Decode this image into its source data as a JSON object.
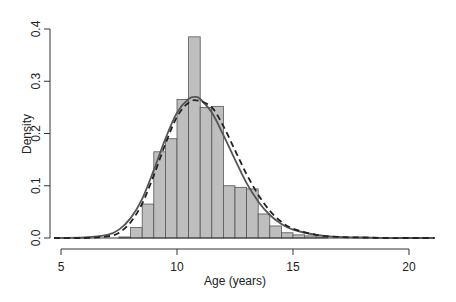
{
  "chart_data": {
    "type": "bar",
    "subtype": "histogram-with-density-curves",
    "title": "",
    "xlabel": "Age (years)",
    "ylabel": "Density",
    "xlim": [
      5,
      21.1
    ],
    "ylim": [
      0,
      0.4
    ],
    "x_ticks": [
      5,
      10,
      15,
      20
    ],
    "y_ticks": [
      0.0,
      0.1,
      0.2,
      0.3,
      0.4
    ],
    "y_tick_labels": [
      "0.0",
      "0.1",
      "0.2",
      "0.3",
      "0.4"
    ],
    "grid": false,
    "legend": null,
    "bin_width": 0.5,
    "bins": [
      {
        "start": 7.5,
        "end": 8.0,
        "density": 0.002
      },
      {
        "start": 8.0,
        "end": 8.5,
        "density": 0.02
      },
      {
        "start": 8.5,
        "end": 9.0,
        "density": 0.065
      },
      {
        "start": 9.0,
        "end": 9.5,
        "density": 0.165
      },
      {
        "start": 9.5,
        "end": 10.0,
        "density": 0.19
      },
      {
        "start": 10.0,
        "end": 10.5,
        "density": 0.265
      },
      {
        "start": 10.5,
        "end": 11.0,
        "density": 0.385
      },
      {
        "start": 11.0,
        "end": 11.5,
        "density": 0.25
      },
      {
        "start": 11.5,
        "end": 12.0,
        "density": 0.252
      },
      {
        "start": 12.0,
        "end": 12.5,
        "density": 0.1
      },
      {
        "start": 12.5,
        "end": 13.0,
        "density": 0.097
      },
      {
        "start": 13.0,
        "end": 13.5,
        "density": 0.094
      },
      {
        "start": 13.5,
        "end": 14.0,
        "density": 0.046
      },
      {
        "start": 14.0,
        "end": 14.5,
        "density": 0.023
      },
      {
        "start": 14.5,
        "end": 15.0,
        "density": 0.01
      },
      {
        "start": 15.0,
        "end": 15.5,
        "density": 0.006
      },
      {
        "start": 15.5,
        "end": 16.0,
        "density": 0.004
      },
      {
        "start": 16.0,
        "end": 16.5,
        "density": 0.002
      }
    ],
    "series": [
      {
        "name": "fitted density (solid)",
        "style": "solid",
        "peak_x": 10.8,
        "peak_y": 0.27,
        "x": [
          4.7,
          6,
          7,
          7.5,
          8,
          8.5,
          9,
          9.5,
          10,
          10.5,
          10.8,
          11,
          11.5,
          12,
          12.5,
          13,
          13.5,
          14,
          14.5,
          15,
          16,
          17,
          18,
          19,
          20,
          21.1
        ],
        "values": [
          0.0,
          0.001,
          0.006,
          0.016,
          0.038,
          0.075,
          0.13,
          0.19,
          0.24,
          0.266,
          0.27,
          0.266,
          0.24,
          0.197,
          0.15,
          0.105,
          0.07,
          0.044,
          0.027,
          0.016,
          0.006,
          0.002,
          0.001,
          0.0,
          0.0,
          0.0
        ]
      },
      {
        "name": "fitted density (dashed)",
        "style": "dashed",
        "peak_x": 10.9,
        "peak_y": 0.263,
        "x": [
          4.7,
          6,
          7,
          7.5,
          8,
          8.5,
          9,
          9.5,
          10,
          10.5,
          10.9,
          11.5,
          12,
          12.5,
          13,
          13.5,
          14,
          14.5,
          15,
          16,
          17,
          18,
          19,
          20,
          21.1
        ],
        "values": [
          0.0,
          0.0,
          0.003,
          0.01,
          0.03,
          0.066,
          0.12,
          0.18,
          0.232,
          0.259,
          0.263,
          0.25,
          0.214,
          0.168,
          0.122,
          0.083,
          0.052,
          0.031,
          0.018,
          0.006,
          0.002,
          0.001,
          0.0,
          0.0,
          0.0
        ]
      }
    ],
    "colors": {
      "bar_fill": "#bebebe",
      "bar_edge": "#555555",
      "curve": "#333333",
      "axis": "#333333"
    }
  }
}
